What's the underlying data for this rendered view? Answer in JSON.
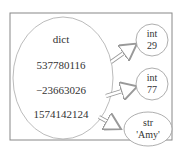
{
  "diagram": {
    "dict_label": "dict",
    "keys": [
      "537780116",
      "−23663026",
      "1574142124"
    ],
    "values": [
      {
        "type": "int",
        "value": "29"
      },
      {
        "type": "int",
        "value": "77"
      },
      {
        "type": "str",
        "value": "'Amy'"
      }
    ],
    "colors": {
      "stroke": "#999999",
      "text": "#333333",
      "arrow": "#a0a0a0"
    }
  }
}
